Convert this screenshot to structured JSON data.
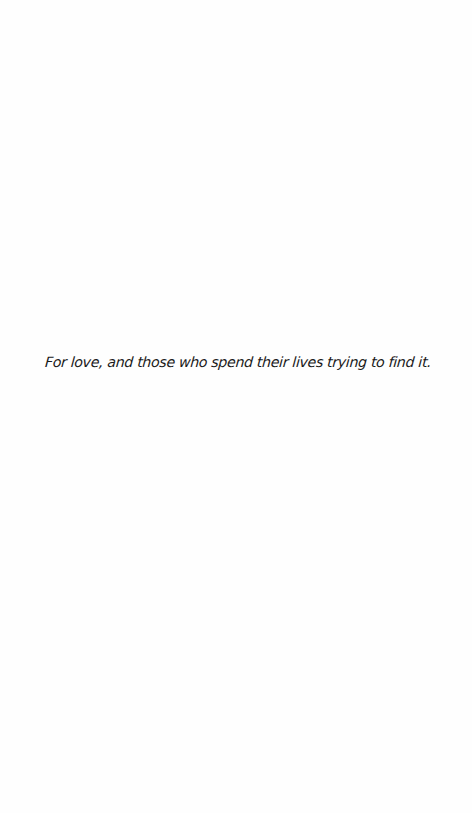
{
  "page": {
    "type": "dedication",
    "background": "#ffffff",
    "text_color": "#1a1a1a"
  },
  "dedication": {
    "text": "For love, and those who spend their lives trying to find it."
  }
}
